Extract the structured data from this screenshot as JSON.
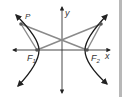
{
  "diagram": {
    "labels": {
      "x_axis": "x",
      "y_axis": "y",
      "point": "P",
      "focus1_main": "F",
      "focus1_sub": "1",
      "focus2_main": "F",
      "focus2_sub": "2"
    },
    "colors": {
      "curve": "#1a1a1a",
      "axes": "#333333",
      "segments": "#8a8a8a",
      "points": "#555555",
      "edge_bar": "#b8b8b8"
    },
    "points": {
      "P": [
        21,
        24
      ],
      "P_mirror": [
        101,
        24
      ],
      "F1": [
        37,
        50
      ],
      "F2": [
        87,
        50
      ]
    }
  }
}
